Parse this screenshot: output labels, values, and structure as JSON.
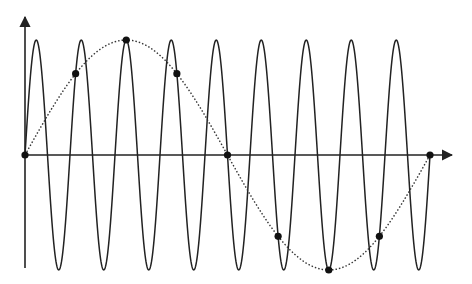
{
  "chart_data": {
    "type": "line",
    "title": "",
    "xlabel": "",
    "ylabel": "",
    "grid": false,
    "legend": null,
    "series": [
      {
        "name": "high-frequency signal",
        "style": "solid",
        "cycles": 9,
        "amplitude": 1.0
      },
      {
        "name": "aliased signal",
        "style": "dotted",
        "cycles": 1,
        "amplitude": 1.0
      },
      {
        "name": "samples",
        "style": "markers",
        "x": [
          0,
          0.125,
          0.25,
          0.375,
          0.5,
          0.625,
          0.75,
          0.875,
          1.0
        ],
        "y": [
          0,
          0.707,
          1.0,
          0.707,
          0,
          -0.707,
          -1.0,
          -0.707,
          0
        ]
      }
    ],
    "xlim": [
      0,
      1.0
    ],
    "ylim": [
      -1.0,
      1.0
    ]
  },
  "layout": {
    "origin_x": 25,
    "origin_y": 155,
    "plot_width": 405,
    "amplitude_px": 115,
    "y_axis_top": 17,
    "y_axis_bottom": 268,
    "x_axis_end": 452,
    "colors": {
      "stroke": "#222222",
      "dot": "#111111",
      "background": "#ffffff"
    }
  }
}
